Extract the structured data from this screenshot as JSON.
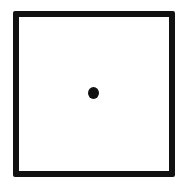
{
  "diagram": {
    "shapes": [
      {
        "type": "square",
        "style": "outline",
        "color": "#111111",
        "border_width": 6
      },
      {
        "type": "dot",
        "style": "filled",
        "color": "#111111",
        "position": "center"
      }
    ],
    "background": "#ffffff"
  }
}
